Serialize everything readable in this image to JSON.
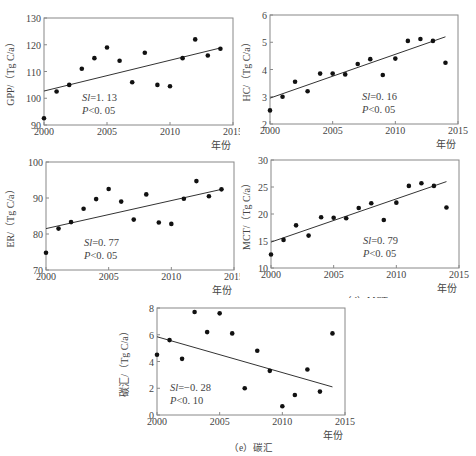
{
  "chart_data": [
    {
      "id": "a",
      "type": "scatter",
      "title": "(a) GPP",
      "xlabel": "年份",
      "ylabel": "GPP/(Tg C/a)",
      "x": [
        2000,
        2001,
        2002,
        2003,
        2004,
        2005,
        2006,
        2007,
        2008,
        2009,
        2010,
        2011,
        2012,
        2013,
        2014
      ],
      "values": [
        92.5,
        102.5,
        105,
        111,
        115,
        119,
        114,
        106,
        117,
        105,
        104.5,
        115,
        122,
        116,
        118.5
      ],
      "trendline": {
        "x": [
          2000,
          2014
        ],
        "y": [
          102.7,
          118.8
        ]
      },
      "annotation": [
        "Sl=1.13",
        "P<0.05"
      ],
      "xlim": [
        2000,
        2015
      ],
      "ylim": [
        90,
        130
      ],
      "xticks": [
        2000,
        2005,
        2010,
        2015
      ],
      "yticks": [
        90,
        100,
        110,
        120,
        130
      ],
      "grid": false
    },
    {
      "id": "b",
      "type": "scatter",
      "title": "(b) HC",
      "xlabel": "年份",
      "ylabel": "HC/(Tg C/a)",
      "x": [
        2000,
        2001,
        2002,
        2003,
        2004,
        2005,
        2006,
        2007,
        2008,
        2009,
        2010,
        2011,
        2012,
        2013,
        2014
      ],
      "values": [
        2.5,
        3.0,
        3.55,
        3.2,
        3.85,
        3.85,
        3.82,
        4.2,
        4.38,
        3.8,
        4.4,
        5.05,
        5.12,
        5.05,
        4.25
      ],
      "trendline": {
        "x": [
          2000,
          2014
        ],
        "y": [
          2.95,
          5.2
        ]
      },
      "annotation": [
        "Sl=0.16",
        "P<0.05"
      ],
      "xlim": [
        2000,
        2015
      ],
      "ylim": [
        2,
        6
      ],
      "xticks": [
        2000,
        2005,
        2010,
        2015
      ],
      "yticks": [
        2,
        3,
        4,
        5,
        6
      ],
      "grid": false
    },
    {
      "id": "c",
      "type": "scatter",
      "title": "(c) ER",
      "xlabel": "年份",
      "ylabel": "ER/(Tg C/a)",
      "x": [
        2000,
        2001,
        2002,
        2003,
        2004,
        2005,
        2006,
        2007,
        2008,
        2009,
        2010,
        2011,
        2012,
        2013,
        2014
      ],
      "values": [
        74.8,
        81.5,
        83.3,
        87,
        89.7,
        92.5,
        89,
        84,
        91,
        83.2,
        82.8,
        89.8,
        94.7,
        90.5,
        92.4
      ],
      "trendline": {
        "x": [
          2000,
          2014
        ],
        "y": [
          81.5,
          92.4
        ]
      },
      "annotation": [
        "Sl=0.77",
        "P<0.05"
      ],
      "xlim": [
        2000,
        2015
      ],
      "ylim": [
        70,
        100
      ],
      "xticks": [
        2000,
        2005,
        2010,
        2015
      ],
      "yticks": [
        70,
        80,
        90,
        100
      ],
      "grid": false
    },
    {
      "id": "d",
      "type": "scatter",
      "title": "(d) MCT",
      "xlabel": "年份",
      "ylabel": "MCT/(Tg C/a)",
      "x": [
        2000,
        2001,
        2002,
        2003,
        2004,
        2005,
        2006,
        2007,
        2008,
        2009,
        2010,
        2011,
        2012,
        2013,
        2014
      ],
      "values": [
        12.5,
        15.2,
        17.9,
        16,
        19.4,
        19.3,
        19.2,
        21.1,
        22,
        18.9,
        22.1,
        25.2,
        25.7,
        25.2,
        21.2
      ],
      "trendline": {
        "x": [
          2000,
          2014
        ],
        "y": [
          14.8,
          26.0
        ]
      },
      "annotation": [
        "Sl=0.79",
        "P<0.05"
      ],
      "xlim": [
        2000,
        2015
      ],
      "ylim": [
        10,
        30
      ],
      "xticks": [
        2000,
        2005,
        2010,
        2015
      ],
      "yticks": [
        10,
        15,
        20,
        25,
        30
      ],
      "grid": false
    },
    {
      "id": "e",
      "type": "scatter",
      "title": "(e) 碳汇",
      "xlabel": "年份",
      "ylabel": "碳汇/(Tg C/a)",
      "x": [
        2000,
        2001,
        2002,
        2003,
        2004,
        2005,
        2006,
        2007,
        2008,
        2009,
        2010,
        2011,
        2012,
        2013,
        2014
      ],
      "values": [
        4.5,
        5.6,
        4.2,
        7.7,
        6.2,
        7.6,
        6.1,
        2.0,
        4.8,
        3.3,
        0.65,
        1.5,
        3.4,
        1.75,
        6.1
      ],
      "trendline": {
        "x": [
          2000,
          2014
        ],
        "y": [
          5.85,
          2.1
        ]
      },
      "annotation": [
        "Sl=-0.28",
        "P<0.10"
      ],
      "xlim": [
        2000,
        2015
      ],
      "ylim": [
        0,
        8
      ],
      "xticks": [
        2000,
        2005,
        2010,
        2015
      ],
      "yticks": [
        0,
        2,
        4,
        6,
        8
      ],
      "grid": false
    }
  ],
  "panels": [
    {
      "caption": "（a）GPP",
      "ylabel": "GPP/（Tg C/a）",
      "xunit": "年份",
      "sl_prefix": "Sl",
      "sl_value": "=1. 13",
      "p_text": "P",
      "p_value": "<0. 05"
    },
    {
      "caption": "（b）HC",
      "ylabel": "HC/（Tg C/a）",
      "xunit": "年份",
      "sl_prefix": "Sl",
      "sl_value": "=0. 16",
      "p_text": "P",
      "p_value": "<0. 05"
    },
    {
      "caption": "（c）ER",
      "ylabel": "ER/（Tg C/a）",
      "xunit": "年份",
      "sl_prefix": "Sl",
      "sl_value": "=0. 77",
      "p_text": "P",
      "p_value": "<0. 05"
    },
    {
      "caption": "（d）MCT",
      "ylabel": "MCT/（Tg C/a）",
      "xunit": "年份",
      "sl_prefix": "Sl",
      "sl_value": "=0. 79",
      "p_text": "P",
      "p_value": "<0. 05"
    },
    {
      "caption": "（e）碳汇",
      "ylabel": "碳汇/（Tg C/a）",
      "xunit": "年份",
      "sl_prefix": "Sl",
      "sl_value": "=−0. 28",
      "p_text": "P",
      "p_value": "<0. 10"
    }
  ],
  "style": {
    "dot_color": "#111111",
    "line_color": "#333333",
    "frame_color": "#888888"
  }
}
